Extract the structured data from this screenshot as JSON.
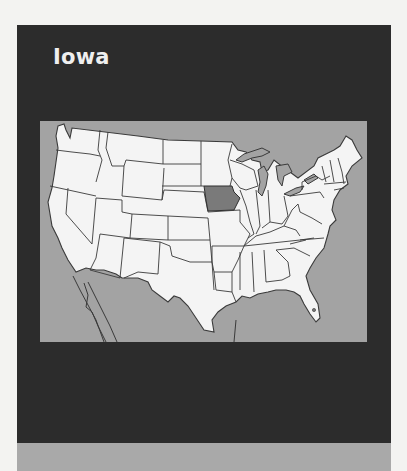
{
  "card": {
    "title": "Iowa",
    "highlighted_state": "Iowa",
    "colors": {
      "card_background": "#2c2c2c",
      "title_text": "#efefef",
      "water": "#a3a3a3",
      "land": "#f4f4f4",
      "highlight": "#7a7a7a",
      "border": "#3a3a3a",
      "footer_band": "#a9a9a9"
    }
  },
  "map": {
    "region": "Contiguous United States",
    "highlight_label": "Iowa"
  }
}
